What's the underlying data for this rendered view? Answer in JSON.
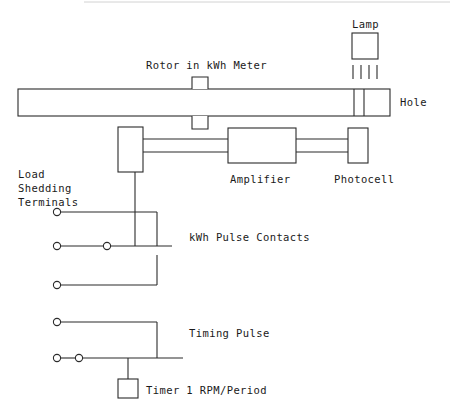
{
  "diagram": {
    "colors": {
      "line": "#2b2b2b",
      "background": "#ffffff",
      "top_edge": "#d2d2d2"
    },
    "labels": {
      "lamp": "Lamp",
      "rotor": "Rotor in kWh Meter",
      "hole": "Hole",
      "amplifier": "Amplifier",
      "photocell": "Photocell",
      "load_shedding_line1": "Load",
      "load_shedding_line2": "Shedding",
      "load_shedding_line3": "Terminals",
      "kwh_pulse_contacts": "kWh Pulse Contacts",
      "timing_pulse": "Timing Pulse",
      "timer": "Timer 1 RPM/Period"
    },
    "components": {
      "lamp_box": {
        "x": 352,
        "y": 33,
        "w": 26,
        "h": 26
      },
      "light_rays": [
        352,
        360,
        368,
        376
      ],
      "rotor_disc_bar": {
        "x": 18,
        "y": 89,
        "w": 372,
        "h": 27
      },
      "rotor_shaft_top": {
        "x": 192,
        "y": 77,
        "w": 16,
        "h": 12
      },
      "rotor_shaft_bottom": {
        "x": 192,
        "y": 116,
        "w": 16,
        "h": 13
      },
      "hole_slots": [
        354,
        364
      ],
      "contact_box": {
        "x": 118,
        "y": 127,
        "w": 25,
        "h": 45
      },
      "amplifier_box": {
        "x": 228,
        "y": 128,
        "w": 68,
        "h": 35
      },
      "photocell_box": {
        "x": 348,
        "y": 128,
        "w": 20,
        "h": 35
      },
      "timer_box": {
        "x": 118,
        "y": 379,
        "w": 20,
        "h": 19
      }
    },
    "terminals": [
      {
        "name": "load-shedding-terminal-1",
        "cx": 57,
        "cy": 212,
        "r": 3.6
      },
      {
        "name": "kwh-contact-terminal-left",
        "cx": 57,
        "cy": 246,
        "r": 3.6
      },
      {
        "name": "kwh-contact-terminal-mid",
        "cx": 107,
        "cy": 246,
        "r": 3.6
      },
      {
        "name": "load-shedding-terminal-2",
        "cx": 57,
        "cy": 285,
        "r": 3.6
      },
      {
        "name": "timing-terminal-top",
        "cx": 57,
        "cy": 322,
        "r": 3.6
      },
      {
        "name": "timing-terminal-left",
        "cx": 57,
        "cy": 358,
        "r": 3.6
      },
      {
        "name": "timing-terminal-mid",
        "cx": 79,
        "cy": 358,
        "r": 3.6
      }
    ]
  }
}
